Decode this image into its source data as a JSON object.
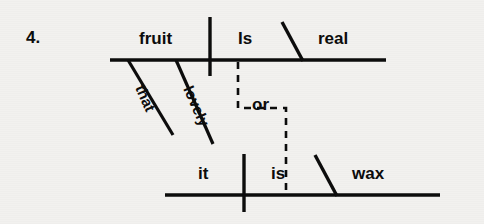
{
  "exercise": {
    "number_label": "4.",
    "type": "sentence-diagram",
    "ink_color": "#0c0c0c",
    "paper_color": "#f2f1ef"
  },
  "main_clause": {
    "subject": "fruit",
    "verb": "Is",
    "predicate_adjective": "real",
    "modifiers": [
      {
        "word": "that",
        "attaches_to": "fruit"
      },
      {
        "word": "lovely",
        "attaches_to": "fruit"
      }
    ]
  },
  "conjunction": {
    "word": "or"
  },
  "second_clause": {
    "subject": "it",
    "verb": "is",
    "predicate_nominative": "wax"
  },
  "geometry": {
    "top_baseline": {
      "x1": 110,
      "y": 60,
      "x2": 386
    },
    "top_subject_divider": {
      "x": 210,
      "y1": 17,
      "y2": 76
    },
    "top_predicate_diagonal": {
      "x1": 282,
      "y1": 22,
      "x2": 302,
      "y2": 60
    },
    "modifier_that": {
      "x1": 128,
      "y1": 60,
      "x2": 172,
      "y2": 134
    },
    "modifier_lovely": {
      "x1": 176,
      "y1": 60,
      "x2": 212,
      "y2": 143
    },
    "bottom_baseline": {
      "x1": 165,
      "y": 195,
      "x2": 440
    },
    "bottom_subject_divider": {
      "x": 244,
      "y1": 154,
      "y2": 212
    },
    "bottom_predicate_diagonal": {
      "x1": 315,
      "y1": 155,
      "x2": 336,
      "y2": 195
    },
    "conjunction_path": {
      "start_x": 238,
      "start_y": 62,
      "corner_y": 108,
      "corner_x": 286,
      "end_y": 193
    }
  }
}
